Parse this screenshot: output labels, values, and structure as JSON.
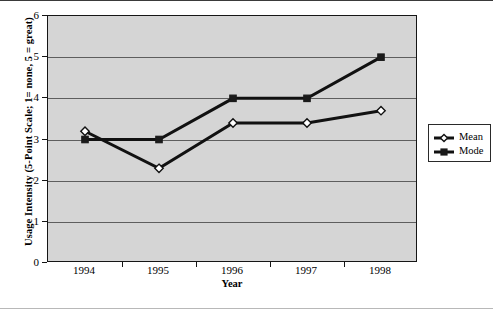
{
  "chart_data": {
    "type": "line",
    "title": "",
    "xlabel": "Year",
    "ylabel": "Usage Intensity (5-Point Scale; 1= none, 5 = great)",
    "categories": [
      "1994",
      "1995",
      "1996",
      "1997",
      "1998"
    ],
    "series": [
      {
        "name": "Mean",
        "marker": "open-diamond",
        "values": [
          3.2,
          2.3,
          3.4,
          3.4,
          3.7
        ]
      },
      {
        "name": "Mode",
        "marker": "filled-square",
        "values": [
          3,
          3,
          4,
          4,
          5
        ]
      }
    ],
    "ylim": [
      0,
      6
    ],
    "yticks": [
      0,
      1,
      2,
      3,
      4,
      5,
      6
    ],
    "ytick_labels": [
      "0",
      "1",
      "2",
      "3",
      "4",
      "5",
      "6"
    ],
    "grid": true,
    "legend_position": "right",
    "plot_background": "#d5d5d5",
    "line_color": "#111111",
    "axis_color": "#151515",
    "gridline_color": "#5e5e5e"
  },
  "legend": {
    "entries": [
      {
        "label": "Mean"
      },
      {
        "label": "Mode"
      }
    ]
  }
}
